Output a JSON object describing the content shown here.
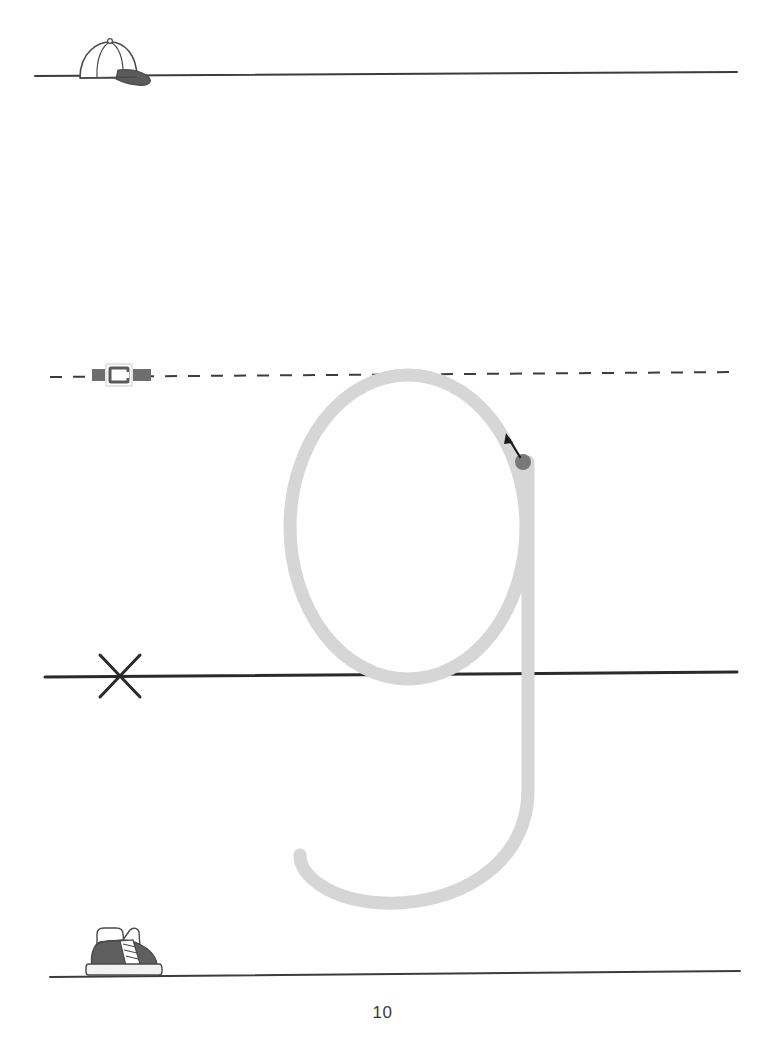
{
  "worksheet": {
    "type": "handwriting-tracing-practice",
    "page_number": "10",
    "target_letter": "g",
    "letter_case": "lowercase",
    "background_color": "#ffffff"
  },
  "guide_lines": [
    {
      "name": "headline",
      "label": "top line",
      "style": "solid",
      "color": "#3c3c3c",
      "thickness": 2,
      "y": 75,
      "x_start": 35,
      "x_end": 737,
      "marker_icon": "baseball-cap-icon",
      "marker_label": "cap",
      "marker_x": 115
    },
    {
      "name": "midline",
      "label": "dashed middle line",
      "style": "dashed",
      "color": "#3c3c3c",
      "thickness": 2,
      "y": 375,
      "x_start": 50,
      "x_end": 740,
      "marker_icon": "belt-buckle-icon",
      "marker_label": "belt",
      "marker_x": 118
    },
    {
      "name": "baseline",
      "label": "base line",
      "style": "solid",
      "color": "#2b2b2b",
      "thickness": 3,
      "y": 675,
      "x_start": 45,
      "x_end": 737,
      "marker_icon": "x-cross-icon",
      "marker_label": "x",
      "marker_x": 120
    },
    {
      "name": "descender-line",
      "label": "bottom line",
      "style": "solid",
      "color": "#3c3c3c",
      "thickness": 2,
      "y": 975,
      "x_start": 50,
      "x_end": 740,
      "marker_icon": "sneaker-shoe-icon",
      "marker_label": "shoe",
      "marker_x": 118
    }
  ],
  "trace_letter": {
    "name": "letter-g-trace",
    "glyph": "g",
    "stroke_color": "#d6d6d6",
    "stroke_width": 13,
    "bowl": {
      "center_x": 408,
      "center_y": 527,
      "radius_x": 118,
      "radius_y": 152,
      "top_y": 375,
      "bottom_y": 679
    },
    "stem_x": 528,
    "stem_top_y": 462,
    "descender_end_x": 300,
    "descender_end_y": 855
  },
  "start_marker": {
    "name": "start-dot",
    "dot_color": "#787878",
    "dot_radius": 8,
    "dot_x": 523,
    "dot_y": 462,
    "arrow_color": "#1a1a1a",
    "arrow_from_x": 519,
    "arrow_from_y": 456,
    "arrow_to_x": 508,
    "arrow_to_y": 437,
    "direction": "up-left"
  },
  "icon_colors": {
    "cap_outline": "#4a4a4a",
    "cap_brim_fill": "#5a5a5a",
    "belt_strap": "#6e6e6e",
    "belt_buckle_outline": "#e8e8e8",
    "belt_buckle_inner": "#5a5a5a",
    "x_mark": "#2b2b2b",
    "shoe_outline": "#4a4a4a",
    "shoe_fill": "#5f5f5f",
    "shoe_sole": "#f2f2f2"
  }
}
